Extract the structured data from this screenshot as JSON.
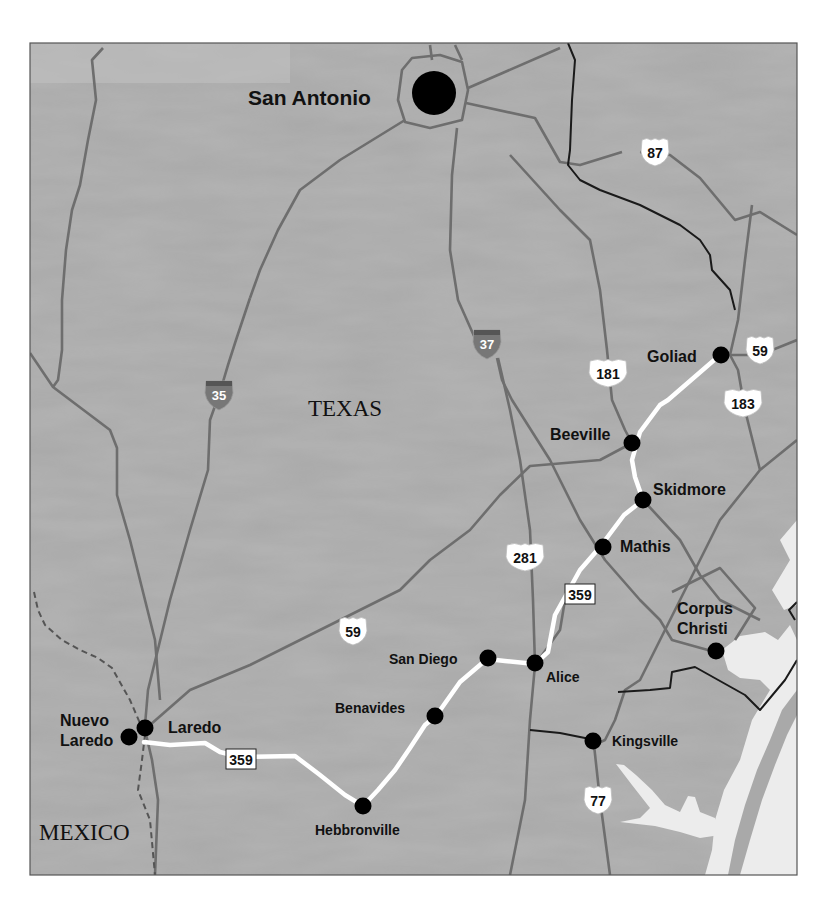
{
  "map": {
    "region_label": "TEXAS",
    "country_label": "MEXICO",
    "colors": {
      "land": "#a9a9a9",
      "water": "#ececec",
      "road": "#6e6e6e",
      "county_line": "#1a1a1a",
      "route": "#ffffff",
      "city_dot": "#000000",
      "frame": "#555555"
    },
    "major_city": {
      "name": "San Antonio"
    },
    "cities": [
      {
        "name": "Goliad"
      },
      {
        "name": "Beeville"
      },
      {
        "name": "Skidmore"
      },
      {
        "name": "Mathis"
      },
      {
        "name": "Corpus",
        "name2": "Christi"
      },
      {
        "name": "San Diego"
      },
      {
        "name": "Alice"
      },
      {
        "name": "Benavides"
      },
      {
        "name": "Kingsville"
      },
      {
        "name": "Laredo"
      },
      {
        "name": "Nuevo",
        "name2": "Laredo"
      },
      {
        "name": "Hebbronville"
      }
    ],
    "highway_shields": {
      "interstate": [
        {
          "number": "35"
        },
        {
          "number": "37"
        }
      ],
      "us": [
        {
          "number": "87"
        },
        {
          "number": "59"
        },
        {
          "number": "181"
        },
        {
          "number": "183"
        },
        {
          "number": "281"
        },
        {
          "number": "59"
        },
        {
          "number": "77"
        }
      ],
      "state": [
        {
          "number": "359"
        },
        {
          "number": "359"
        }
      ]
    }
  }
}
